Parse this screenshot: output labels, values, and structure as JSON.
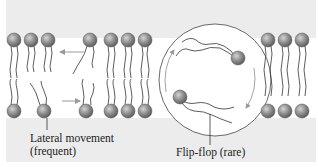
{
  "figure": {
    "labels": {
      "lateral_line1": "Lateral movement",
      "lateral_line2": "(frequent)",
      "flipflop": "Flip-flop (rare)"
    },
    "colors": {
      "background": "#ececec",
      "band": "#ffffff",
      "head_fill": "#8a8a8a",
      "head_highlight": "#c8c8c8",
      "tail_stroke": "#333333",
      "arrow": "#999999",
      "circle_stroke": "#444444"
    },
    "elements": {
      "top_heads_left": 3,
      "bottom_heads_left": 3,
      "top_heads_middle": 4,
      "bottom_heads_middle": 4,
      "top_heads_right": 3,
      "bottom_heads_right": 3,
      "flip_flop_lipids": 2,
      "lateral_arrows": 2,
      "flipflop_arrows": 2
    }
  }
}
